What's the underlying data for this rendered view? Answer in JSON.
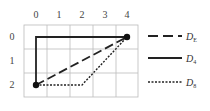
{
  "grid": {
    "columns": [
      "0",
      "1",
      "2",
      "3",
      "4"
    ],
    "rows": [
      "0",
      "1",
      "2"
    ],
    "line_color": "#bbbbbb"
  },
  "points": [
    {
      "label": "p",
      "col": 0,
      "row": 2
    },
    {
      "label": "q",
      "col": 4,
      "row": 0
    }
  ],
  "paths": [
    {
      "name": "D_E",
      "style": "dashed",
      "color": "#222222",
      "route": [
        [
          0,
          2
        ],
        [
          4,
          0
        ]
      ]
    },
    {
      "name": "D_4",
      "style": "solid",
      "color": "#222222",
      "route": [
        [
          0,
          2
        ],
        [
          0,
          0
        ],
        [
          4,
          0
        ]
      ]
    },
    {
      "name": "D_8",
      "style": "dotted",
      "color": "#222222",
      "route": [
        [
          0,
          2
        ],
        [
          2,
          2
        ],
        [
          4,
          0
        ]
      ]
    }
  ],
  "legend": [
    {
      "main": "D",
      "sub": "E",
      "style": "dashed"
    },
    {
      "main": "D",
      "sub": "4",
      "style": "solid"
    },
    {
      "main": "D",
      "sub": "8",
      "style": "dotted"
    }
  ]
}
